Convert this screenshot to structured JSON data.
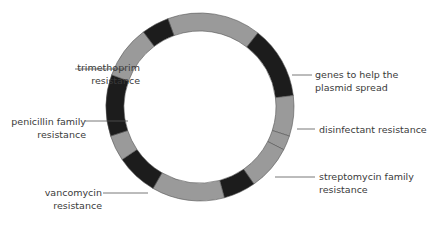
{
  "diagram": {
    "type": "plasmid-ring",
    "colors": {
      "dark": "#1c1c1c",
      "light": "#9a9a9a",
      "line": "#555555",
      "background": "#ffffff"
    },
    "ring": {
      "cx": 200,
      "cy": 107,
      "outer_r": 94,
      "inner_r": 76
    },
    "segments": [
      {
        "start": -20,
        "end": 38,
        "shade": "light"
      },
      {
        "start": 38,
        "end": 83,
        "shade": "dark"
      },
      {
        "start": 83,
        "end": 108,
        "shade": "light"
      },
      {
        "start": 108,
        "end": 117,
        "shade": "light"
      },
      {
        "start": 117,
        "end": 145,
        "shade": "light"
      },
      {
        "start": 145,
        "end": 165,
        "shade": "dark"
      },
      {
        "start": 165,
        "end": 210,
        "shade": "light"
      },
      {
        "start": 210,
        "end": 236,
        "shade": "dark"
      },
      {
        "start": 236,
        "end": 252,
        "shade": "light"
      },
      {
        "start": 252,
        "end": 290,
        "shade": "dark"
      },
      {
        "start": 290,
        "end": 323,
        "shade": "light"
      },
      {
        "start": 323,
        "end": 340,
        "shade": "dark"
      }
    ],
    "labels": [
      {
        "id": "trimethoprim",
        "line1": "trimethoprim",
        "line2": "resistance",
        "side": "left",
        "text_right": 140,
        "top": 61,
        "line": [
          75,
          69,
          125,
          69
        ]
      },
      {
        "id": "penicillin",
        "line1": "penicillin family",
        "line2": "resistance",
        "side": "left",
        "text_right": 140,
        "top": 115,
        "line": [
          85,
          121,
          128,
          121
        ]
      },
      {
        "id": "vancomycin",
        "line1": "vancomycin",
        "line2": "resistance",
        "side": "left",
        "text_right": 140,
        "top": 186,
        "line": [
          103,
          193,
          148,
          193
        ]
      },
      {
        "id": "genes-spread",
        "line1": "genes to help the",
        "line2": "plasmid spread",
        "side": "right",
        "text_left": 315,
        "top": 68,
        "line": [
          292,
          75,
          312,
          75
        ]
      },
      {
        "id": "disinfectant",
        "line1": "disinfectant resistance",
        "line2": "",
        "side": "right",
        "text_left": 318,
        "top": 123,
        "line": [
          297,
          129,
          315,
          129
        ]
      },
      {
        "id": "streptomycin",
        "line1": "streptomycin family",
        "line2": "resistance",
        "side": "right",
        "text_left": 318,
        "top": 170,
        "line": [
          275,
          177,
          315,
          177
        ]
      }
    ]
  }
}
